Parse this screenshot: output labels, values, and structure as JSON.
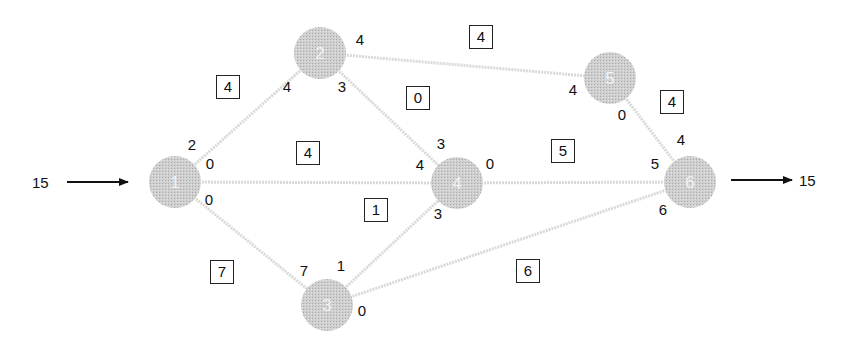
{
  "diagram": {
    "type": "flow-network",
    "source_flow": "15",
    "sink_flow": "15",
    "colors": {
      "node_fill": "#c8c8c8",
      "edge": "#d9d9d9",
      "node_label": "#f2f2f2",
      "text": "#111111"
    },
    "nodes": [
      {
        "id": "1",
        "label": "1",
        "x": 175,
        "y": 182
      },
      {
        "id": "2",
        "label": "2",
        "x": 320,
        "y": 53
      },
      {
        "id": "3",
        "label": "3",
        "x": 327,
        "y": 305
      },
      {
        "id": "4",
        "label": "4",
        "x": 457,
        "y": 183
      },
      {
        "id": "5",
        "label": "5",
        "x": 610,
        "y": 78
      },
      {
        "id": "6",
        "label": "6",
        "x": 690,
        "y": 182
      }
    ],
    "edges": [
      {
        "from": "1",
        "to": "2",
        "flow": "4",
        "box_x": 228,
        "box_y": 87,
        "cap_from": "2",
        "cap_from_x": 192,
        "cap_from_y": 145,
        "cap_to": "4",
        "cap_to_x": 287,
        "cap_to_y": 87
      },
      {
        "from": "1",
        "to": "4",
        "flow": "4",
        "box_x": 308,
        "box_y": 153,
        "cap_from": "0",
        "cap_from_x": 210,
        "cap_from_y": 164,
        "cap_to": "4",
        "cap_to_x": 420,
        "cap_to_y": 165
      },
      {
        "from": "1",
        "to": "3",
        "flow": "7",
        "box_x": 222,
        "box_y": 272,
        "cap_from": "0",
        "cap_from_x": 209,
        "cap_from_y": 200,
        "cap_to": "7",
        "cap_to_x": 304,
        "cap_to_y": 271
      },
      {
        "from": "2",
        "to": "4",
        "flow": "0",
        "box_x": 418,
        "box_y": 98,
        "cap_from": "3",
        "cap_from_x": 342,
        "cap_from_y": 87,
        "cap_to": "3",
        "cap_to_x": 441,
        "cap_to_y": 144
      },
      {
        "from": "2",
        "to": "5",
        "flow": "4",
        "box_x": 481,
        "box_y": 37,
        "cap_from": "4",
        "cap_from_x": 360,
        "cap_from_y": 40,
        "cap_to": "4",
        "cap_to_x": 573,
        "cap_to_y": 90
      },
      {
        "from": "3",
        "to": "4",
        "flow": "1",
        "box_x": 376,
        "box_y": 210,
        "cap_from": "1",
        "cap_from_x": 341,
        "cap_from_y": 266,
        "cap_to": "3",
        "cap_to_x": 438,
        "cap_to_y": 214
      },
      {
        "from": "4",
        "to": "6",
        "flow": "5",
        "box_x": 563,
        "box_y": 151,
        "cap_from": "0",
        "cap_from_x": 490,
        "cap_from_y": 164,
        "cap_to": "5",
        "cap_to_x": 655,
        "cap_to_y": 164
      },
      {
        "from": "5",
        "to": "6",
        "flow": "4",
        "box_x": 672,
        "box_y": 102,
        "cap_from": "0",
        "cap_from_x": 622,
        "cap_from_y": 115,
        "cap_to": "4",
        "cap_to_x": 681,
        "cap_to_y": 140
      },
      {
        "from": "3",
        "to": "6",
        "flow": "6",
        "box_x": 528,
        "box_y": 271,
        "cap_from": "0",
        "cap_from_x": 362,
        "cap_from_y": 311,
        "cap_to": "6",
        "cap_to_x": 663,
        "cap_to_y": 210
      }
    ]
  }
}
